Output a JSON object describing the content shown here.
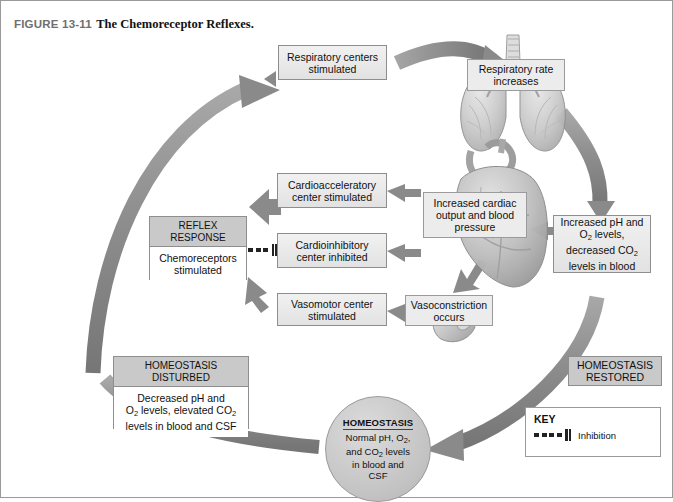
{
  "figure": {
    "number": "FIGURE 13-11",
    "title": "The Chemoreceptor Reflexes."
  },
  "nodes": {
    "respiratory_centers": "Respiratory centers stimulated",
    "respiratory_rate": "Respiratory rate increases",
    "cardioaccel": "Cardioacceleratory center stimulated",
    "cardioinhib": "Cardioinhibitory center inhibited",
    "vasomotor": "Vasomotor center stimulated",
    "vasoconstriction": "Vasoconstriction occurs",
    "cardiac_output": "Increased cardiac output and blood pressure",
    "blood_gas_restored_l1": "Increased pH and",
    "blood_gas_restored_l2": "O",
    "blood_gas_restored_l2b": " levels,",
    "blood_gas_restored_l3": "decreased CO",
    "blood_gas_restored_l4": "levels in blood"
  },
  "reflex_response": {
    "header_l1": "REFLEX",
    "header_l2": "RESPONSE",
    "body": "Chemoreceptors stimulated"
  },
  "homeostasis_disturbed": {
    "header_l1": "HOMEOSTASIS",
    "header_l2": "DISTURBED",
    "body_l1": "Decreased pH and",
    "body_l2_pre": "O",
    "body_l2_post": " levels, elevated CO",
    "body_l3": "levels in blood and CSF"
  },
  "homeostasis_restored": {
    "l1": "HOMEOSTASIS",
    "l2": "RESTORED"
  },
  "homeostasis_center": {
    "heading": "HOMEOSTASIS",
    "l1_pre": "Normal pH, O",
    "l1_post": ",",
    "l2_pre": "and CO",
    "l2_post": " levels",
    "l3": "in blood and",
    "l4": "CSF"
  },
  "key": {
    "title": "KEY",
    "inhibition_label": "Inhibition"
  },
  "icons": {
    "lungs": "lungs-illustration",
    "heart": "heart-illustration",
    "vessel": "blood-vessel-illustration"
  },
  "colors": {
    "arrow_gray": "#8e8e8e",
    "box_fill": "#ececec",
    "header_fill": "#c9c9c9",
    "circle_fill": "#c2c2c2",
    "text": "#111111",
    "figure_label": "#6f6f6f"
  },
  "subscripts": {
    "o2": "2",
    "co2": "2"
  }
}
